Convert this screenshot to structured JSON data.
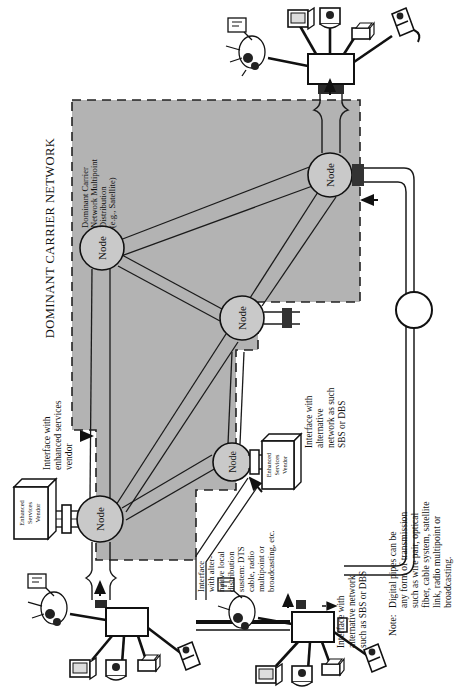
{
  "figure": {
    "title": "DOMINANT CARRIER NETWORK",
    "orientation": "rotated-90-ccw",
    "background": "#ffffff",
    "region_fill": "#b3b3b3",
    "line_color": "#1a1a1a"
  },
  "labels": {
    "network_title": "DOMINANT CARRIER NETWORK",
    "multipoint": "Dominant Carrier\nNetwork Multipoint\nDistribution\n(e.g., Satellite)",
    "multipoint_lines": [
      "Dominant Carrier",
      "Network Multipoint",
      "Distribution",
      "(e.g., Satellite)"
    ],
    "iface_enhanced_lines": [
      "Interface with",
      "enhanced services",
      "vendor"
    ],
    "iface_alt_local_lines": [
      "Interface",
      "with alter-",
      "native local",
      "distribution",
      "sustem: DTS",
      "cable, radio",
      "multipoint or",
      "broadcasting, etc."
    ],
    "iface_alt_network_right_lines": [
      "Interface with",
      "alternative",
      "network as such",
      "SBS or DBS"
    ],
    "iface_alt_network_bottom_lines": [
      "Interface with",
      "alternative network",
      "such as SBS or DBS"
    ],
    "note_prefix": "Note:",
    "note_lines": [
      "Digital pipes can be",
      "any form of transmission",
      "such as wire pair, optical",
      "fiber, cable system, satellite",
      "link, radio multipoint or",
      "broadcasting."
    ],
    "vendor_box_lines": [
      "Enhanced",
      "Services",
      "Vendor"
    ],
    "node_label": "Node"
  },
  "nodes": [
    {
      "id": "node-top",
      "label": "Node",
      "cx": 330,
      "cy": 175
    },
    {
      "id": "node-left",
      "label": "Node",
      "cx": 102,
      "cy": 248
    },
    {
      "id": "node-mid",
      "label": "Node",
      "cx": 242,
      "cy": 318
    },
    {
      "id": "node-lower",
      "label": "Node",
      "cx": 232,
      "cy": 462
    },
    {
      "id": "node-bottom",
      "label": "Node",
      "cx": 100,
      "cy": 519
    }
  ],
  "links": [
    {
      "from": "node-top",
      "to": "node-left"
    },
    {
      "from": "node-top",
      "to": "node-mid"
    },
    {
      "from": "node-left",
      "to": "node-mid"
    },
    {
      "from": "node-left",
      "to": "node-bottom"
    },
    {
      "from": "node-mid",
      "to": "node-bottom"
    },
    {
      "from": "node-lower",
      "to": "node-bottom"
    },
    {
      "from": "node-lower",
      "to": "node-mid"
    }
  ],
  "vendor_boxes": [
    {
      "id": "vendor-left",
      "x": 14,
      "y": 487
    },
    {
      "id": "vendor-right",
      "x": 262,
      "y": 441
    }
  ],
  "terminal_clusters": [
    {
      "id": "cluster-top",
      "hub_x": 334,
      "hub_y": 62
    },
    {
      "id": "cluster-bottom-left",
      "hub_x": 122,
      "hub_y": 604
    },
    {
      "id": "cluster-bottom-right",
      "hub_x": 310,
      "hub_y": 613
    }
  ],
  "icons": {
    "node": "node-circle-icon",
    "terminal_hub": "terminal-hub-icon",
    "monitor": "monitor-icon",
    "computer": "computer-icon",
    "printer": "printer-icon",
    "phone": "telephone-icon",
    "person": "person-at-desk-icon",
    "dish": "satellite-dish-icon",
    "pipe": "digital-pipe-icon",
    "connector": "pipe-connector-icon",
    "arrow": "arrow-icon"
  }
}
